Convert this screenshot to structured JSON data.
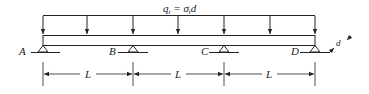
{
  "diagram": {
    "type": "continuous beam, three spans, uniformly distributed load",
    "load_label": {
      "q": "q",
      "q_sub": "t",
      "eq": " = ",
      "sigma": "σ",
      "sigma_sub": "t",
      "d": "d"
    },
    "supports": [
      {
        "id": "A",
        "label": "A"
      },
      {
        "id": "B",
        "label": "B"
      },
      {
        "id": "C",
        "label": "C"
      },
      {
        "id": "D",
        "label": "D"
      }
    ],
    "spans": [
      {
        "label": "L"
      },
      {
        "label": "L"
      },
      {
        "label": "L"
      }
    ],
    "end_dimension_label": "d",
    "color": "#222222"
  }
}
